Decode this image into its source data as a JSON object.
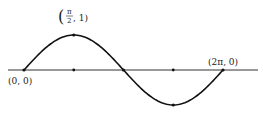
{
  "chart_data": {
    "type": "line",
    "title": "",
    "function": "y = sin(x)",
    "x": [
      0,
      0.7854,
      1.5708,
      2.3562,
      3.1416,
      3.927,
      4.7124,
      5.4978,
      6.2832
    ],
    "y": [
      0,
      0.7071,
      1,
      0.7071,
      0,
      -0.7071,
      -1,
      -0.7071,
      0
    ],
    "xlim": [
      0,
      6.2832
    ],
    "ylim": [
      -1,
      1
    ],
    "grid": false,
    "legend": null,
    "xlabel": "",
    "ylabel": "",
    "marked_points": [
      {
        "x": 0,
        "y": 0,
        "label": "(0, 0)"
      },
      {
        "x": 1.5708,
        "y": 1,
        "label": "(π/2, 1)"
      },
      {
        "x": 3.1416,
        "y": 0,
        "label": ""
      },
      {
        "x": 4.7124,
        "y": -1,
        "label": ""
      },
      {
        "x": 6.2832,
        "y": 0,
        "label": "(2π, 0)"
      }
    ]
  },
  "labels": {
    "origin": "(0, 0)",
    "peak_open": "(",
    "peak_num": "π",
    "peak_den": "2",
    "peak_rest": ", 1)",
    "end": "(2π, 0)"
  }
}
